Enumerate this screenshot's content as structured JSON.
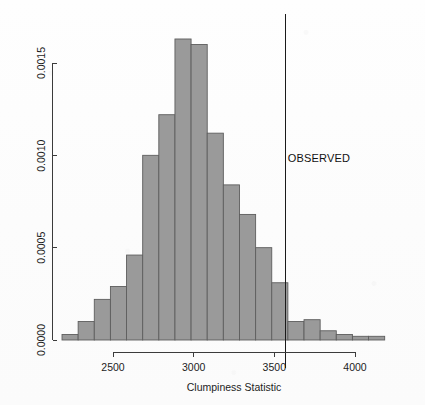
{
  "chart_data": {
    "type": "bar",
    "title": "",
    "subtitle": "",
    "xlabel": "Clumpiness Statistic",
    "ylabel": "",
    "xlim": [
      2150,
      4250
    ],
    "ylim": [
      0.0,
      0.00168
    ],
    "grid": false,
    "legend": "none",
    "bin_width": 100,
    "bin_starts": [
      2184,
      2284,
      2384,
      2484,
      2584,
      2684,
      2784,
      2884,
      2984,
      3084,
      3184,
      3284,
      3384,
      3484,
      3584,
      3684,
      3784,
      3884,
      3984,
      4084
    ],
    "categories": [
      "2184-2284",
      "2284-2384",
      "2384-2484",
      "2484-2584",
      "2584-2684",
      "2684-2784",
      "2784-2884",
      "2884-2984",
      "2984-3084",
      "3084-3184",
      "3184-3284",
      "3284-3384",
      "3384-3484",
      "3484-3584",
      "3584-3684",
      "3684-3784",
      "3784-3884",
      "3884-3984",
      "3984-4084",
      "4084-4184"
    ],
    "values": [
      3e-05,
      0.0001,
      0.00022,
      0.00029,
      0.00046,
      0.001,
      0.00122,
      0.00163,
      0.0016,
      0.00112,
      0.00084,
      0.00068,
      0.0005,
      0.00031,
      0.0001,
      0.00011,
      5e-05,
      3e-05,
      2e-05,
      2e-05
    ],
    "xticks": [
      2500,
      3000,
      3500,
      4000
    ],
    "xtick_labels": [
      "2500",
      "3000",
      "3500",
      "4000"
    ],
    "yticks": [
      0.0,
      0.0005,
      0.001,
      0.0015
    ],
    "ytick_labels": [
      "0.0000",
      "0.0005",
      "0.0010",
      "0.0015"
    ],
    "annotations": [
      {
        "name": "observed-marker",
        "label": "OBSERVED",
        "x": 3570,
        "type": "vline"
      }
    ],
    "colors": {
      "bar_fill": "#9a9a9a",
      "bar_stroke": "#5e5e5e",
      "axis": "#3b3b3b",
      "observed_line": "#1a1a1a",
      "background": "#fdfdfd"
    }
  },
  "labels": {
    "observed": "OBSERVED",
    "x_axis_title": "Clumpiness Statistic"
  }
}
